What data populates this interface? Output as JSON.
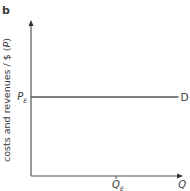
{
  "panel_label": "b",
  "chart_data": {
    "type": "line",
    "title": "",
    "xlabel": "Q",
    "ylabel": "costs and revenues / $ (P)",
    "ylabel_parts": {
      "main": "costs and revenues / $ (",
      "var": "P",
      "close": ")"
    },
    "xlim": [
      0,
      1
    ],
    "ylim": [
      0,
      1
    ],
    "grid": false,
    "series": [
      {
        "name": "D",
        "label": "D",
        "x": [
          0,
          0.97
        ],
        "y": [
          0.5,
          0.5
        ],
        "color": "#555555"
      }
    ],
    "y_ticks": [
      {
        "value": 0.5,
        "label": "P",
        "sub": "E"
      }
    ],
    "x_ticks": [
      {
        "value": 0.56,
        "label": "Q",
        "sub": "E"
      }
    ],
    "axis_color": "#555555"
  }
}
